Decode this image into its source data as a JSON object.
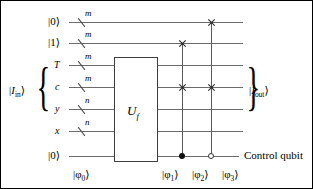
{
  "figure": {
    "type": "quantum-circuit-diagram",
    "width": 313,
    "height": 189,
    "background": "#ffffff",
    "wire_color": "#6b6b6b",
    "ink_color": "#000000"
  },
  "input_group": {
    "label": "|I",
    "label_sub": "in",
    "label_end": "⟩",
    "full_label": "|I_in⟩",
    "covers_wires": [
      "c",
      "y",
      "x"
    ]
  },
  "output_group": {
    "label": "|I",
    "label_sub": "out",
    "label_end": "⟩",
    "full_label": "|I_out⟩"
  },
  "wires": [
    {
      "id": "w1",
      "label": "|0⟩",
      "kind": "ket",
      "bus": "m",
      "has_slash": true
    },
    {
      "id": "w2",
      "label": "|1⟩",
      "kind": "ket",
      "bus": "m",
      "has_slash": true
    },
    {
      "id": "w3",
      "label": "T",
      "kind": "plain",
      "bus": "m",
      "has_slash": true
    },
    {
      "id": "w4",
      "label": "c",
      "kind": "plain",
      "bus": "m",
      "has_slash": true
    },
    {
      "id": "w5",
      "label": "y",
      "kind": "plain",
      "bus": "n",
      "has_slash": true
    },
    {
      "id": "w6",
      "label": "x",
      "kind": "plain",
      "bus": "n",
      "has_slash": true
    },
    {
      "id": "w7",
      "label": "|0⟩",
      "kind": "ket",
      "bus": "",
      "has_slash": false
    }
  ],
  "gate": {
    "name": "U",
    "subscript": "f",
    "full_label": "U_f"
  },
  "gates": {
    "swap_1": {
      "type": "swap",
      "control": "filled-dot",
      "top_wire": "w2",
      "bottom_wire": "w4",
      "control_wire": "w7"
    },
    "swap_2": {
      "type": "swap",
      "control": "open-circle",
      "top_wire": "w1",
      "bottom_wire": "w4",
      "control_wire": "w7"
    }
  },
  "state_labels": {
    "phi0": "|φ",
    "phi0_sub": "0",
    "phi1_sub": "1",
    "phi2_sub": "2",
    "phi3_sub": "3",
    "close": "⟩"
  },
  "annotations": {
    "control_qubit": "Control qubit"
  }
}
